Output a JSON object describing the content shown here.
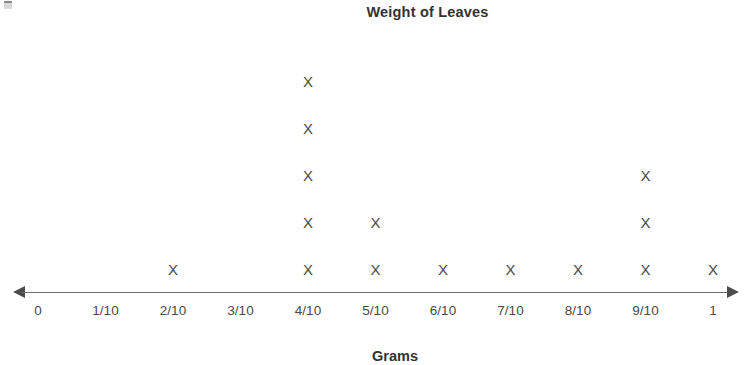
{
  "chart_data": {
    "type": "scatter",
    "plot_style": "line-plot-dot-plot",
    "title": "Weight of Leaves",
    "xlabel": "Grams",
    "ylabel": "",
    "categories": [
      "0",
      "1/10",
      "2/10",
      "3/10",
      "4/10",
      "5/10",
      "6/10",
      "7/10",
      "8/10",
      "9/10",
      "1"
    ],
    "x": [
      0,
      0.1,
      0.2,
      0.3,
      0.4,
      0.5,
      0.6,
      0.7,
      0.8,
      0.9,
      1
    ],
    "values": [
      0,
      0,
      1,
      0,
      5,
      2,
      1,
      1,
      1,
      3,
      1
    ],
    "marker": "X",
    "total_count": 15,
    "xlim": [
      0,
      1
    ],
    "grid": false,
    "legend": false,
    "legend_position": "none"
  },
  "chart": {
    "title": "Weight of Leaves",
    "axis_caption": "Grams",
    "marker_glyph": "X",
    "colors": {
      "marker": "#4a4a4a",
      "axis": "#6b6b6b",
      "arrow": "#4d4d4d",
      "title": "#333333",
      "tick": "#4a4a4a",
      "background": "#ffffff"
    },
    "columns": [
      {
        "label": "0",
        "count": 0
      },
      {
        "label": "1/10",
        "count": 0
      },
      {
        "label": "2/10",
        "count": 1
      },
      {
        "label": "3/10",
        "count": 0
      },
      {
        "label": "4/10",
        "count": 5
      },
      {
        "label": "5/10",
        "count": 2
      },
      {
        "label": "6/10",
        "count": 1
      },
      {
        "label": "7/10",
        "count": 1
      },
      {
        "label": "8/10",
        "count": 1
      },
      {
        "label": "9/10",
        "count": 3
      },
      {
        "label": "1",
        "count": 1
      }
    ]
  }
}
